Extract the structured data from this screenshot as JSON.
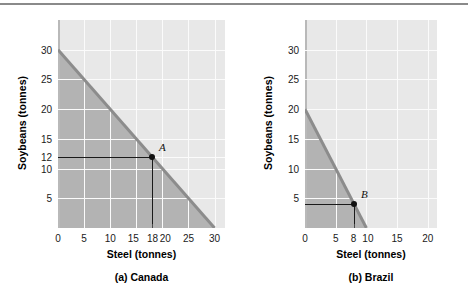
{
  "figure": {
    "top_rule_color": "#8a8a8a",
    "plot_background": "#e8e8e8",
    "feasible_region_color": "#b3b3b3",
    "ppf_line_color": "#8c8c8c",
    "gridline_color": "#fbfbfb",
    "marker_color": "#111111",
    "guide_line_color": "#1a1a1a"
  },
  "chart_data": [
    {
      "type": "line",
      "title": "(a) Canada",
      "xlabel": "Steel (tonnes)",
      "ylabel": "Soybeans (tonnes)",
      "xlim": [
        0,
        32
      ],
      "ylim": [
        0,
        35
      ],
      "grid": true,
      "legend": "none",
      "xticks": [
        0,
        5,
        10,
        15,
        18,
        20,
        25,
        30
      ],
      "xticklabels": [
        "0",
        "5",
        "10",
        "15",
        "18",
        "20",
        "25",
        "30"
      ],
      "yticks": [
        5,
        10,
        12,
        15,
        20,
        25,
        30
      ],
      "yticklabels": [
        "5",
        "10",
        "12",
        "15",
        "20",
        "25",
        "30"
      ],
      "series": [
        {
          "name": "Production possibilities frontier",
          "x": [
            0,
            30
          ],
          "values": [
            30,
            0
          ]
        }
      ],
      "annotations": [
        {
          "label": "A",
          "x": 18,
          "y": 12,
          "guide_x": true,
          "guide_y": true
        }
      ],
      "shaded_region": "area under the PPF (attainable production combinations)",
      "opportunity_cost_steel_in_soybeans": 1
    },
    {
      "type": "line",
      "title": "(b) Brazil",
      "xlabel": "Steel (tonnes)",
      "ylabel": "Soybeans (tonnes)",
      "xlim": [
        0,
        21.5
      ],
      "ylim": [
        0,
        35
      ],
      "grid": true,
      "legend": "none",
      "xticks": [
        0,
        5,
        8,
        10,
        15,
        20
      ],
      "xticklabels": [
        "0",
        "5",
        "8",
        "10",
        "15",
        "20"
      ],
      "yticks": [
        5,
        10,
        15,
        20,
        25,
        30
      ],
      "yticklabels": [
        "5",
        "10",
        "15",
        "20",
        "25",
        "30"
      ],
      "series": [
        {
          "name": "Production possibilities frontier",
          "x": [
            0,
            10
          ],
          "values": [
            20,
            0
          ]
        }
      ],
      "annotations": [
        {
          "label": "B",
          "x": 8,
          "y": 4,
          "guide_x": true,
          "guide_y": true
        }
      ],
      "shaded_region": "area under the PPF (attainable production combinations)",
      "opportunity_cost_steel_in_soybeans": 2
    }
  ]
}
